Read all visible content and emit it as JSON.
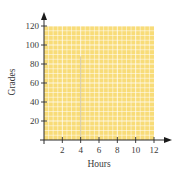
{
  "chart_data": {
    "type": "scatter",
    "title": "",
    "xlabel": "Hours",
    "ylabel": "Grades",
    "xlim": [
      0,
      12
    ],
    "ylim": [
      0,
      120
    ],
    "x_ticks": [
      2,
      4,
      6,
      8,
      10,
      12
    ],
    "y_ticks": [
      20,
      40,
      60,
      80,
      100,
      120
    ],
    "x_tick_labels": [
      "2",
      "4",
      "6",
      "8",
      "10",
      "12"
    ],
    "y_tick_labels": [
      "20",
      "40",
      "60",
      "80",
      "100",
      "120"
    ],
    "grid": true,
    "grid_fill_color": "#F8DC78",
    "grid_line_color": "#FFFFFF",
    "series": [],
    "annotations": [],
    "legend": null
  },
  "axes": {
    "x_title": "Hours",
    "y_title": "Grades"
  }
}
